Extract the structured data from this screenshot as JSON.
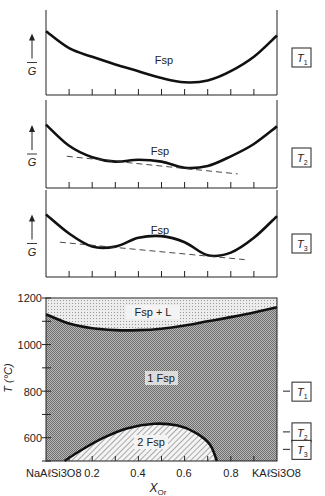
{
  "panels": [
    {
      "id": "T1",
      "phase_label": "Fsp",
      "y_axis_label": "G",
      "temp_box": "T",
      "temp_sub": "1"
    },
    {
      "id": "T2",
      "phase_label": "Fsp",
      "y_axis_label": "G",
      "temp_box": "T",
      "temp_sub": "2"
    },
    {
      "id": "T3",
      "phase_label": "Fsp",
      "y_axis_label": "G",
      "temp_box": "T",
      "temp_sub": "3"
    }
  ],
  "phase_diagram": {
    "y_axis_label": "T (°C)",
    "y_ticks": [
      "1200",
      "1000",
      "800",
      "600"
    ],
    "x_ticks": [
      "0.2",
      "0.4",
      "0.6",
      "0.8"
    ],
    "x_left_endmember": "NaAℓSi3O8",
    "x_right_endmember": "KAℓSi3O8",
    "x_axis_label": "X",
    "x_axis_sub": "Or",
    "region_labels": {
      "liquid": "Fsp + L",
      "one_phase": "1 Fsp",
      "two_phase": "2 Fsp"
    },
    "temp_markers": [
      {
        "label": "T",
        "sub": "1",
        "temp_c": 800
      },
      {
        "label": "T",
        "sub": "2",
        "temp_c": 625
      },
      {
        "label": "T",
        "sub": "3",
        "temp_c": 550
      }
    ]
  },
  "chart_data": [
    {
      "type": "line",
      "title": "Free energy vs composition at T1",
      "xlabel": "X_Or",
      "ylabel": "G",
      "x": [
        0,
        0.1,
        0.2,
        0.3,
        0.4,
        0.5,
        0.6,
        0.7,
        0.8,
        0.9,
        1.0
      ],
      "series": [
        {
          "name": "Fsp",
          "values": [
            0.75,
            0.55,
            0.45,
            0.36,
            0.28,
            0.2,
            0.15,
            0.17,
            0.28,
            0.45,
            0.7
          ]
        }
      ],
      "ylim": [
        0,
        1
      ]
    },
    {
      "type": "line",
      "title": "Free energy vs composition at T2",
      "xlabel": "X_Or",
      "ylabel": "G",
      "x": [
        0,
        0.1,
        0.2,
        0.3,
        0.4,
        0.5,
        0.6,
        0.7,
        0.8,
        0.9,
        1.0
      ],
      "series": [
        {
          "name": "Fsp",
          "values": [
            0.72,
            0.48,
            0.35,
            0.3,
            0.32,
            0.3,
            0.23,
            0.25,
            0.36,
            0.5,
            0.7
          ]
        },
        {
          "name": "common tangent",
          "style": "dashed",
          "x_range": [
            0.09,
            0.83
          ],
          "values_at_ends": [
            0.36,
            0.16
          ]
        }
      ],
      "ylim": [
        0,
        1
      ]
    },
    {
      "type": "line",
      "title": "Free energy vs composition at T3",
      "xlabel": "X_Or",
      "ylabel": "G",
      "x": [
        0,
        0.1,
        0.2,
        0.3,
        0.4,
        0.5,
        0.6,
        0.7,
        0.8,
        0.9,
        1.0
      ],
      "series": [
        {
          "name": "Fsp",
          "values": [
            0.72,
            0.5,
            0.35,
            0.35,
            0.45,
            0.47,
            0.4,
            0.25,
            0.28,
            0.45,
            0.7
          ]
        },
        {
          "name": "common tangent",
          "style": "dashed",
          "x_range": [
            0.06,
            0.86
          ],
          "values_at_ends": [
            0.4,
            0.2
          ]
        }
      ],
      "ylim": [
        0,
        1
      ]
    },
    {
      "type": "area",
      "title": "Alkali feldspar T–X phase diagram",
      "xlabel": "X_Or",
      "ylabel": "T (°C)",
      "xlim": [
        0,
        1
      ],
      "ylim": [
        500,
        1200
      ],
      "x_ticks": [
        0.2,
        0.4,
        0.6,
        0.8
      ],
      "y_ticks": [
        600,
        800,
        1000,
        1200
      ],
      "series": [
        {
          "name": "solidus",
          "x": [
            0,
            0.1,
            0.2,
            0.3,
            0.4,
            0.5,
            0.6,
            0.7,
            0.8,
            0.9,
            1.0
          ],
          "values": [
            1130,
            1090,
            1070,
            1062,
            1062,
            1068,
            1082,
            1100,
            1118,
            1138,
            1160
          ]
        },
        {
          "name": "solvus",
          "x": [
            0.08,
            0.15,
            0.25,
            0.35,
            0.47,
            0.57,
            0.65,
            0.71,
            0.74
          ],
          "values": [
            500,
            545,
            600,
            640,
            660,
            652,
            620,
            570,
            500
          ]
        }
      ],
      "regions": [
        "Fsp + L",
        "1 Fsp",
        "2 Fsp"
      ]
    }
  ]
}
